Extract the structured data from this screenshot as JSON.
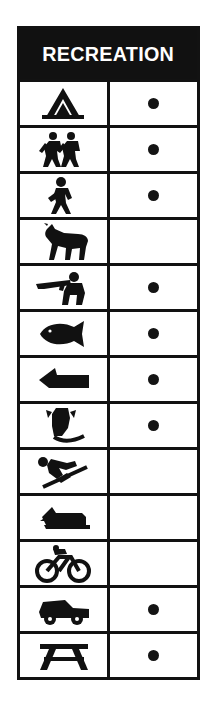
{
  "header": {
    "title": "RECREATION"
  },
  "columns": {
    "icon_header": "",
    "availability_header": ""
  },
  "colors": {
    "ink": "#111111",
    "paper": "#ffffff",
    "header_background": "#111111",
    "header_text": "#ffffff"
  },
  "rows": [
    {
      "icon": "camping-tent-icon",
      "label": "Camping",
      "available": true
    },
    {
      "icon": "hiking-icon",
      "label": "Hiking",
      "available": true
    },
    {
      "icon": "walking-trail-icon",
      "label": "Walking",
      "available": true
    },
    {
      "icon": "horseback-riding-icon",
      "label": "Horseback Riding",
      "available": false
    },
    {
      "icon": "hunting-icon",
      "label": "Hunting",
      "available": true
    },
    {
      "icon": "fishing-icon",
      "label": "Fishing",
      "available": true
    },
    {
      "icon": "boat-launch-icon",
      "label": "Boating",
      "available": true
    },
    {
      "icon": "water-skiing-icon",
      "label": "Water Skiing",
      "available": true
    },
    {
      "icon": "snow-skiing-icon",
      "label": "Snow Skiing",
      "available": false
    },
    {
      "icon": "snowmobile-icon",
      "label": "Snowmobiling",
      "available": false
    },
    {
      "icon": "bicycling-icon",
      "label": "Bicycling",
      "available": false
    },
    {
      "icon": "off-road-vehicle-icon",
      "label": "Off-Road Vehicle",
      "available": true
    },
    {
      "icon": "picnic-table-icon",
      "label": "Picnic Area",
      "available": true
    }
  ],
  "dot_symbol": "●"
}
